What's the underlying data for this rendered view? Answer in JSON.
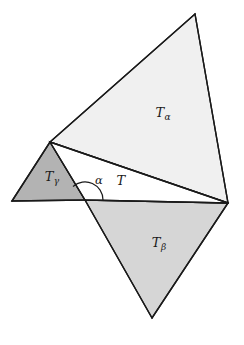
{
  "figure": {
    "type": "geometric-diagram",
    "width": 244,
    "height": 345,
    "background_color": "#ffffff",
    "stroke_color": "#1a1a1a",
    "stroke_width": 1.4
  },
  "vertices": {
    "left_base": {
      "x": 12,
      "y": 201
    },
    "apex_alpha": {
      "x": 85,
      "y": 200
    },
    "upper_left": {
      "x": 50,
      "y": 142
    },
    "right": {
      "x": 228,
      "y": 203
    },
    "top_alpha": {
      "x": 195,
      "y": 14
    },
    "bottom_beta": {
      "x": 152,
      "y": 318
    }
  },
  "regions": [
    {
      "id": "triangle-alpha",
      "label": "T",
      "subscript": "α",
      "fill": "#f0f0f0",
      "points": "50,142 195,14 228,203",
      "label_x": 163,
      "label_y": 114
    },
    {
      "id": "triangle-beta",
      "label": "T",
      "subscript": "β",
      "fill": "#d6d6d6",
      "points": "85,200 228,203 152,318",
      "label_x": 159,
      "label_y": 244
    },
    {
      "id": "triangle-gamma",
      "label": "T",
      "subscript": "γ",
      "fill": "#b3b3b3",
      "points": "12,201 50,142 85,200",
      "label_x": 52,
      "label_y": 178
    },
    {
      "id": "triangle-center",
      "label": "T",
      "subscript": "",
      "fill": "#ffffff",
      "points": "50,142 228,203 85,200",
      "label_x": 121,
      "label_y": 182
    }
  ],
  "angle_mark": {
    "label": "α",
    "vertex_x": 85,
    "vertex_y": 200,
    "radius": 18,
    "label_x": 99,
    "label_y": 181,
    "arc_path": "M 103 200 A 18 18 0 0 0 73 186.5"
  },
  "edges": [
    {
      "name": "base-left-to-apex",
      "from": "left_base",
      "to": "apex_alpha"
    },
    {
      "name": "apex-to-right",
      "from": "apex_alpha",
      "to": "right"
    },
    {
      "name": "left-base-to-upper-left",
      "from": "left_base",
      "to": "upper_left"
    },
    {
      "name": "upper-left-to-apex",
      "from": "upper_left",
      "to": "apex_alpha"
    },
    {
      "name": "upper-left-to-right",
      "from": "upper_left",
      "to": "right"
    },
    {
      "name": "upper-left-to-top",
      "from": "upper_left",
      "to": "top_alpha"
    },
    {
      "name": "top-to-right",
      "from": "top_alpha",
      "to": "right"
    },
    {
      "name": "apex-to-bottom",
      "from": "apex_alpha",
      "to": "bottom_beta"
    },
    {
      "name": "bottom-to-right",
      "from": "bottom_beta",
      "to": "right"
    }
  ]
}
